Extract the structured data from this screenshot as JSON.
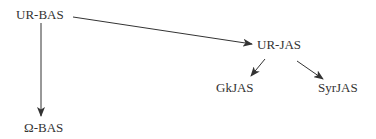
{
  "diagram": {
    "type": "stemma-tree",
    "colors": {
      "text": "#333333",
      "edge": "#333333",
      "background": "#ffffff"
    },
    "nodes": [
      {
        "id": "ur_bas",
        "label": "UR-BAS",
        "x": 16,
        "y": 8
      },
      {
        "id": "omega_bas",
        "label": "Ω-BAS",
        "x": 24,
        "y": 121
      },
      {
        "id": "ur_jas",
        "label": "UR-JAS",
        "x": 257,
        "y": 38
      },
      {
        "id": "gkjas",
        "label": "GkJAS",
        "x": 216,
        "y": 81
      },
      {
        "id": "syrjas",
        "label": "SyrJAS",
        "x": 318,
        "y": 81
      }
    ],
    "edges": [
      {
        "from": "ur_bas",
        "to": "omega_bas"
      },
      {
        "from": "ur_bas",
        "to": "ur_jas"
      },
      {
        "from": "ur_jas",
        "to": "gkjas"
      },
      {
        "from": "ur_jas",
        "to": "syrjas"
      }
    ]
  }
}
